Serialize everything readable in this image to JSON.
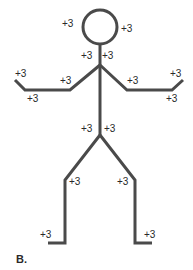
{
  "figure": {
    "panel_label": "B.",
    "stroke_color": "#4a4a4a",
    "label_color": "#2a2a2a",
    "segments": {
      "head": "+3",
      "neck": "+3",
      "upper_arm": "+3",
      "forearm": "+3",
      "hand": "+3",
      "trunk": "+3",
      "thigh": "+3",
      "lower_leg": "+3",
      "foot": "+3"
    },
    "labels": [
      {
        "id": "head-left",
        "text": "+3",
        "x": 62,
        "y": 24
      },
      {
        "id": "head-right",
        "text": "+3",
        "x": 121,
        "y": 24
      },
      {
        "id": "neck-left",
        "text": "+3",
        "x": 81,
        "y": 51
      },
      {
        "id": "neck-right",
        "text": "+3",
        "x": 102,
        "y": 51
      },
      {
        "id": "left-hand-top",
        "text": "+3",
        "x": 15,
        "y": 69
      },
      {
        "id": "left-forearm",
        "text": "+3",
        "x": 27,
        "y": 94
      },
      {
        "id": "left-upper-arm",
        "text": "+3",
        "x": 60,
        "y": 76
      },
      {
        "id": "right-upper-arm",
        "text": "+3",
        "x": 127,
        "y": 76
      },
      {
        "id": "right-hand-top",
        "text": "+3",
        "x": 170,
        "y": 69
      },
      {
        "id": "right-forearm",
        "text": "+3",
        "x": 166,
        "y": 94
      },
      {
        "id": "trunk-left",
        "text": "+3",
        "x": 81,
        "y": 124
      },
      {
        "id": "trunk-right",
        "text": "+3",
        "x": 104,
        "y": 124
      },
      {
        "id": "left-thigh",
        "text": "+3",
        "x": 69,
        "y": 177
      },
      {
        "id": "right-thigh",
        "text": "+3",
        "x": 117,
        "y": 177
      },
      {
        "id": "left-foot",
        "text": "+3",
        "x": 40,
        "y": 230
      },
      {
        "id": "right-foot",
        "text": "+3",
        "x": 144,
        "y": 230
      }
    ]
  }
}
